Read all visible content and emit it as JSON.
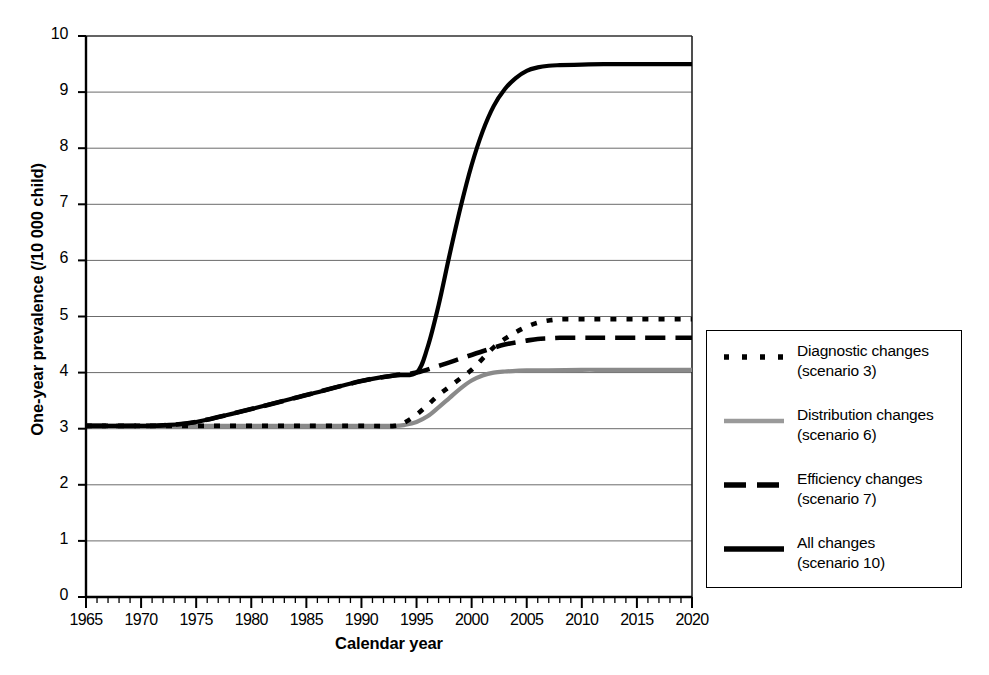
{
  "chart_data": {
    "type": "line",
    "title": "",
    "xlabel": "Calendar year",
    "ylabel": "One-year prevalence (/10 000 child)",
    "xlim": [
      1965,
      2020
    ],
    "ylim": [
      0,
      10
    ],
    "xticks": [
      1965,
      1970,
      1975,
      1980,
      1985,
      1990,
      1995,
      2000,
      2005,
      2010,
      2015,
      2020
    ],
    "yticks": [
      0,
      1,
      2,
      3,
      4,
      5,
      6,
      7,
      8,
      9,
      10
    ],
    "xtick_labels": [
      "1965",
      "1970",
      "1975",
      "1980",
      "1985",
      "1990",
      "1995",
      "2000",
      "2005",
      "2010",
      "2015",
      "2020"
    ],
    "ytick_labels": [
      "0",
      "1",
      "2",
      "3",
      "4",
      "5",
      "6",
      "7",
      "8",
      "9",
      "10"
    ],
    "x_minor_tick_step": 1,
    "grid": "horizontal",
    "legend_position": "right-outside",
    "series": [
      {
        "name": "Diagnostic changes",
        "scenario": "(scenario 3)",
        "legend_label": "Diagnostic changes",
        "legend_sublabel": "(scenario 3)",
        "style": "fine-dashed",
        "color": "#000000",
        "x": [
          1965,
          1970,
          1975,
          1980,
          1985,
          1990,
          1993,
          1994,
          1995,
          1996,
          1997,
          1998,
          1999,
          2000,
          2001,
          2002,
          2003,
          2004,
          2005,
          2006,
          2007,
          2008,
          2010,
          2012,
          2015,
          2018,
          2020
        ],
        "y": [
          3.05,
          3.05,
          3.05,
          3.05,
          3.05,
          3.05,
          3.05,
          3.12,
          3.25,
          3.42,
          3.6,
          3.75,
          3.9,
          4.05,
          4.25,
          4.45,
          4.6,
          4.72,
          4.82,
          4.89,
          4.93,
          4.95,
          4.95,
          4.95,
          4.95,
          4.95,
          4.95
        ]
      },
      {
        "name": "Distribution changes",
        "scenario": "(scenario 6)",
        "legend_label": "Distribution changes",
        "legend_sublabel": "(scenario 6)",
        "style": "gray-solid",
        "color": "#8a8a8a",
        "x": [
          1965,
          1970,
          1975,
          1980,
          1985,
          1990,
          1993,
          1994,
          1995,
          1996,
          1997,
          1998,
          1999,
          2000,
          2001,
          2002,
          2003,
          2004,
          2005,
          2007,
          2010,
          2012,
          2015,
          2018,
          2020
        ],
        "y": [
          3.05,
          3.05,
          3.05,
          3.05,
          3.05,
          3.05,
          3.05,
          3.07,
          3.12,
          3.22,
          3.38,
          3.55,
          3.72,
          3.86,
          3.95,
          4.0,
          4.02,
          4.03,
          4.04,
          4.04,
          4.05,
          4.05,
          4.05,
          4.05,
          4.05
        ]
      },
      {
        "name": "Efficiency changes",
        "scenario": "(scenario 7)",
        "legend_label": "Efficiency changes",
        "legend_sublabel": "(scenario 7)",
        "style": "long-dashed",
        "color": "#000000",
        "x": [
          1965,
          1970,
          1972,
          1975,
          1980,
          1985,
          1990,
          1993,
          1995,
          1997,
          1999,
          2001,
          2003,
          2005,
          2006,
          2007,
          2008,
          2010,
          2012,
          2015,
          2018,
          2020
        ],
        "y": [
          3.05,
          3.05,
          3.06,
          3.12,
          3.35,
          3.6,
          3.85,
          3.95,
          4.0,
          4.12,
          4.25,
          4.38,
          4.5,
          4.57,
          4.6,
          4.61,
          4.62,
          4.62,
          4.62,
          4.62,
          4.62,
          4.62
        ]
      },
      {
        "name": "All changes",
        "scenario": "(scenario 10)",
        "legend_label": "All changes",
        "legend_sublabel": "(scenario 10)",
        "style": "solid",
        "color": "#000000",
        "x": [
          1965,
          1970,
          1972,
          1975,
          1980,
          1985,
          1990,
          1993,
          1995,
          1996,
          1997,
          1998,
          1999,
          2000,
          2001,
          2002,
          2003,
          2004,
          2005,
          2006,
          2007,
          2008,
          2010,
          2012,
          2015,
          2018,
          2020
        ],
        "y": [
          3.05,
          3.05,
          3.06,
          3.12,
          3.35,
          3.6,
          3.85,
          3.95,
          4.0,
          4.45,
          5.2,
          6.1,
          6.95,
          7.7,
          8.3,
          8.75,
          9.05,
          9.25,
          9.38,
          9.44,
          9.47,
          9.48,
          9.49,
          9.5,
          9.5,
          9.5,
          9.5
        ]
      }
    ]
  },
  "axes": {
    "ylabel": "One-year prevalence (/10 000 child)",
    "xlabel": "Calendar year"
  }
}
